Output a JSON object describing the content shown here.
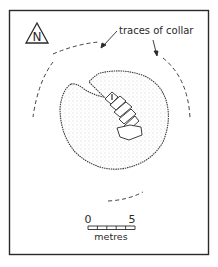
{
  "figure": {
    "type": "archaeological-site-plan",
    "north_label": "N",
    "annotation": "traces of collar",
    "scale_bar": {
      "start_label": "0",
      "end_label": "5",
      "unit_label": "metres",
      "divisions": 5
    },
    "colors": {
      "ink": "#2a2a2a",
      "stipple": "#8a8a8a",
      "background": "#ffffff"
    }
  }
}
